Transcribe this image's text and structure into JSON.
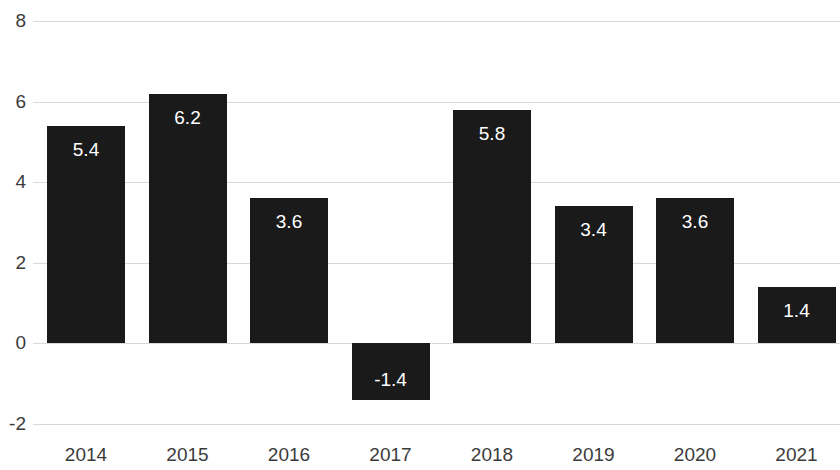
{
  "chart_data": {
    "type": "bar",
    "title": "",
    "subtitle": "",
    "xlabel": "",
    "ylabel": "",
    "categories": [
      "2014",
      "2015",
      "2016",
      "2017",
      "2018",
      "2019",
      "2020",
      "2021"
    ],
    "values": [
      5.4,
      6.2,
      3.6,
      -1.4,
      5.8,
      3.4,
      3.6,
      1.4
    ],
    "data_labels": [
      "5.4",
      "6.2",
      "3.6",
      "-1.4",
      "5.8",
      "3.4",
      "3.6",
      "1.4"
    ],
    "ylim": [
      -2,
      8
    ],
    "y_ticks": [
      8,
      6,
      4,
      2,
      0,
      -2
    ],
    "y_tick_labels": [
      "8",
      "6",
      "4",
      "2",
      "0",
      "-2"
    ],
    "grid": true,
    "grid_axis": "y",
    "legend": null,
    "legend_position": "none",
    "series": [
      {
        "name": "",
        "values": [
          5.4,
          6.2,
          3.6,
          -1.4,
          5.8,
          3.4,
          3.6,
          1.4
        ]
      }
    ],
    "colors": {
      "bar": "#1a1a1a",
      "gridline": "#d9d9d9",
      "background": "#ffffff",
      "tick_label": "#3b3b3b",
      "data_label": "#ffffff"
    }
  }
}
